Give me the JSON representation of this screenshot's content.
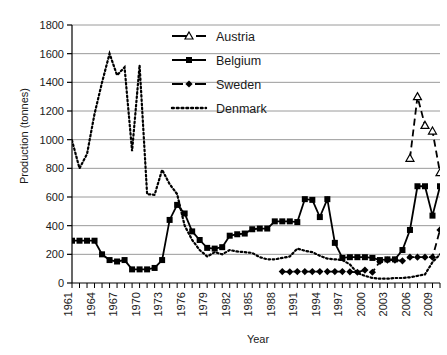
{
  "chart_data": {
    "type": "line",
    "title": "",
    "xlabel": "Year",
    "ylabel": "Production (tonnes)",
    "xlim": [
      1961,
      2010
    ],
    "ylim": [
      0,
      1800
    ],
    "ytick_values": [
      0,
      200,
      400,
      600,
      800,
      1000,
      1200,
      1400,
      1600,
      1800
    ],
    "ytick_labels": [
      "0",
      "200",
      "400",
      "600",
      "800",
      "1000",
      "1200",
      "1400",
      "1600",
      "1800"
    ],
    "xtick_labels": [
      "1961",
      "1964",
      "1967",
      "1970",
      "1973",
      "1976",
      "1979",
      "1982",
      "1985",
      "1988",
      "1991",
      "1994",
      "1997",
      "2000",
      "2003",
      "2006",
      "2009"
    ],
    "xtick_step_years": 3,
    "minor_xticks_every_year": true,
    "grid": "horizontal",
    "grid_color": "#9a9a9a",
    "legend_position": "top-center",
    "series": [
      {
        "name": "Austria",
        "line_style": "dashed",
        "marker": "triangle-open",
        "color": "#000000",
        "x": [
          2006,
          2007,
          2008,
          2009,
          2010
        ],
        "values": [
          870,
          1300,
          1100,
          1060,
          770
        ]
      },
      {
        "name": "Belgium",
        "line_style": "solid",
        "marker": "square",
        "color": "#000000",
        "x": [
          1961,
          1962,
          1963,
          1964,
          1965,
          1966,
          1967,
          1968,
          1969,
          1970,
          1971,
          1972,
          1973,
          1974,
          1975,
          1976,
          1977,
          1978,
          1979,
          1980,
          1981,
          1982,
          1983,
          1984,
          1985,
          1986,
          1987,
          1988,
          1989,
          1990,
          1991,
          1992,
          1993,
          1994,
          1995,
          1996,
          1997,
          1998,
          1999,
          2000,
          2001,
          2002,
          2003,
          2004,
          2005,
          2006,
          2007,
          2008,
          2009,
          2010
        ],
        "values": [
          295,
          295,
          295,
          295,
          200,
          160,
          150,
          160,
          95,
          95,
          95,
          105,
          160,
          440,
          545,
          485,
          360,
          300,
          245,
          240,
          250,
          330,
          340,
          345,
          375,
          380,
          380,
          430,
          430,
          430,
          425,
          585,
          580,
          460,
          585,
          280,
          175,
          180,
          180,
          180,
          175,
          160,
          165,
          165,
          230,
          370,
          675,
          675,
          470,
          675
        ]
      },
      {
        "name": "Sweden",
        "line_style": "dashed",
        "marker": "diamond",
        "color": "#000000",
        "x": [
          1989,
          1990,
          1991,
          1992,
          1993,
          1994,
          1995,
          1996,
          1997,
          1998,
          1999,
          2000,
          2001,
          2002,
          2003,
          2004,
          2005,
          2006,
          2007,
          2008,
          2009,
          2010
        ],
        "values": [
          80,
          78,
          80,
          80,
          80,
          80,
          80,
          80,
          80,
          78,
          75,
          90,
          75,
          150,
          160,
          160,
          155,
          180,
          180,
          180,
          180,
          370
        ]
      },
      {
        "name": "Denmark",
        "line_style": "dotted",
        "marker": "none",
        "color": "#000000",
        "x": [
          1961,
          1962,
          1963,
          1964,
          1965,
          1966,
          1967,
          1968,
          1969,
          1970,
          1971,
          1972,
          1973,
          1974,
          1975,
          1976,
          1977,
          1978,
          1979,
          1980,
          1981,
          1982,
          1983,
          1984,
          1985,
          1986,
          1987,
          1988,
          1989,
          1990,
          1991,
          1992,
          1993,
          1994,
          1995,
          1996,
          1997,
          1998,
          1999,
          2000,
          2001,
          2002,
          2003,
          2004,
          2005,
          2006,
          2007,
          2008,
          2009,
          2010
        ],
        "values": [
          995,
          800,
          900,
          1180,
          1400,
          1600,
          1450,
          1505,
          920,
          1520,
          620,
          615,
          790,
          690,
          620,
          400,
          300,
          230,
          185,
          215,
          200,
          230,
          220,
          215,
          210,
          180,
          165,
          165,
          175,
          185,
          240,
          225,
          215,
          190,
          170,
          165,
          160,
          130,
          70,
          50,
          35,
          30,
          30,
          35,
          35,
          40,
          50,
          60,
          145,
          200
        ]
      }
    ]
  },
  "legend": {
    "items": [
      {
        "label": "Austria"
      },
      {
        "label": "Belgium"
      },
      {
        "label": "Sweden"
      },
      {
        "label": "Denmark"
      }
    ]
  },
  "axes": {
    "x_title": "Year",
    "y_title": "Production (tonnes)"
  }
}
